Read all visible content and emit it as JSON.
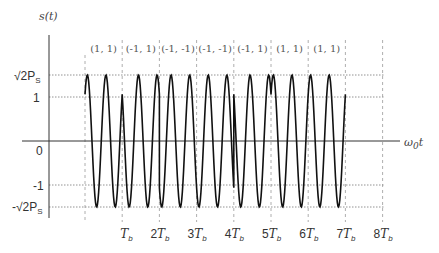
{
  "diagram": {
    "y_axis_label": "s(t)",
    "x_axis_label": "ω₀t",
    "y_levels": [
      {
        "label": "√2P_S",
        "value": 1.414
      },
      {
        "label": "1",
        "value": 1
      },
      {
        "label": "0",
        "value": 0
      },
      {
        "label": "-1",
        "value": -1
      },
      {
        "label": "-√2P_S",
        "value": -1.414
      }
    ],
    "x_ticks": [
      "T_b",
      "2T_b",
      "3T_b",
      "4T_b",
      "5T_b",
      "6T_b",
      "7T_b",
      "8T_b"
    ],
    "symbol_pairs": [
      "(1, 1)",
      "(-1, 1)",
      "(-1, -1)",
      "(-1, -1)",
      "(-1, 1)",
      "(1, 1)",
      "(1, 1)"
    ],
    "cycles_per_bit": 2
  },
  "labels": {
    "s_t": "s(t)",
    "sqrt2ps": "√2P",
    "sqrt2ps_sub": "S",
    "neg_sqrt2ps": "-√2P",
    "one": "1",
    "zero": "0",
    "neg_one": "-1",
    "omega_t": "ω",
    "omega_sub": "0",
    "omega_t_suffix": "t",
    "tb": [
      "T",
      "2T",
      "3T",
      "4T",
      "5T",
      "6T",
      "7T",
      "8T"
    ],
    "tb_sub": "b",
    "pairs": [
      "(1, 1)",
      "(-1, 1)",
      "(-1, -1)",
      "(-1, -1)",
      "(-1, 1)",
      "(1, 1)",
      "(1, 1)"
    ]
  }
}
